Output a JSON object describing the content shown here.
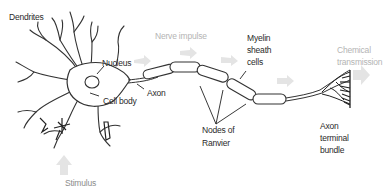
{
  "diagram": {
    "labels": {
      "dendrites": "Dendrites",
      "nucleus": "Nucleus",
      "cell_body": "Cell body",
      "axon": "Axon",
      "nerve_impulse": "Nerve impulse",
      "myelin_line1": "Myelin",
      "myelin_line2": "sheath",
      "myelin_line3": "cells",
      "nodes_line1": "Nodes of",
      "nodes_line2": "Ranvier",
      "chemical_line1": "Chemical",
      "chemical_line2": "transmission",
      "terminal_line1": "Axon",
      "terminal_line2": "terminal",
      "terminal_line3": "bundle",
      "stimulus": "Stimulus"
    },
    "colors": {
      "ink": "#2a2a2a",
      "faded_text": "#b4b4b4",
      "arrow_fill": "#e2e2e2",
      "background": "#ffffff"
    }
  }
}
